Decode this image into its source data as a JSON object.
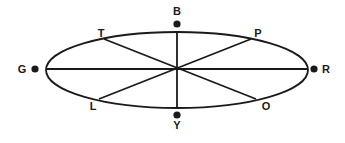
{
  "figure": {
    "type": "ellipse-diagram",
    "background_color": "#ffffff",
    "stroke_color": "#1a1a1a",
    "label_color": "#1a1a1a"
  },
  "ellipse": {
    "center_x": 177,
    "center_y": 70,
    "radius_x": 131,
    "radius_y": 38,
    "stroke_width": 1.8
  },
  "points": [
    {
      "id": "G",
      "label": "G",
      "label_x": 22,
      "label_y": 73,
      "dot_x": 35,
      "dot_y": 69,
      "dot_radius": 3.6,
      "has_dot": true,
      "position": "left"
    },
    {
      "id": "R",
      "label": "R",
      "label_x": 326,
      "label_y": 73,
      "dot_x": 314,
      "dot_y": 69,
      "dot_radius": 3.6,
      "has_dot": true,
      "position": "right"
    },
    {
      "id": "B",
      "label": "B",
      "label_x": 177,
      "label_y": 15,
      "dot_x": 177,
      "dot_y": 24,
      "dot_radius": 3.6,
      "has_dot": true,
      "position": "top"
    },
    {
      "id": "Y",
      "label": "Y",
      "label_x": 177,
      "label_y": 129,
      "dot_x": 177,
      "dot_y": 115,
      "dot_radius": 3.6,
      "has_dot": true,
      "position": "bottom"
    },
    {
      "id": "T",
      "label": "T",
      "label_x": 101,
      "label_y": 37,
      "dot_x": 0,
      "dot_y": 0,
      "dot_radius": 0,
      "has_dot": false,
      "position": "upper-left"
    },
    {
      "id": "P",
      "label": "P",
      "label_x": 258,
      "label_y": 37,
      "dot_x": 0,
      "dot_y": 0,
      "dot_radius": 0,
      "has_dot": false,
      "position": "upper-right"
    },
    {
      "id": "L",
      "label": "L",
      "label_x": 93,
      "label_y": 110,
      "dot_x": 0,
      "dot_y": 0,
      "dot_radius": 0,
      "has_dot": false,
      "position": "lower-left"
    },
    {
      "id": "O",
      "label": "O",
      "label_x": 266,
      "label_y": 110,
      "dot_x": 0,
      "dot_y": 0,
      "dot_radius": 0,
      "has_dot": false,
      "position": "lower-right"
    }
  ],
  "diameters": [
    {
      "id": "horizontal-G-R",
      "from": "G",
      "to": "R",
      "x1": 46,
      "y1": 69,
      "x2": 308,
      "y2": 69
    },
    {
      "id": "vertical-B-Y",
      "from": "B",
      "to": "Y",
      "x1": 177,
      "y1": 32,
      "x2": 177,
      "y2": 108
    },
    {
      "id": "diagonal-T-O",
      "from": "T",
      "to": "O",
      "x1": 104,
      "y1": 39,
      "x2": 256,
      "y2": 99
    },
    {
      "id": "diagonal-P-L",
      "from": "P",
      "to": "L",
      "x1": 251,
      "y1": 39,
      "x2": 99,
      "y2": 99
    }
  ]
}
